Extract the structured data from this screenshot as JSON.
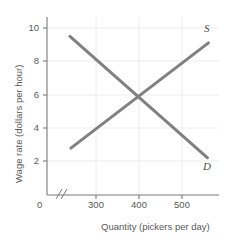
{
  "chart_data": {
    "type": "line",
    "title": "",
    "xlabel": "Quantity (pickers per day)",
    "ylabel": "Wage rate (dollars per hour)",
    "xlim": [
      200,
      575
    ],
    "ylim": [
      0,
      11
    ],
    "xticks": [
      300,
      400,
      500
    ],
    "xtick_labels": [
      "300",
      "400",
      "500"
    ],
    "yticks": [
      0,
      2,
      4,
      6,
      8,
      10
    ],
    "ytick_labels": [
      "0",
      "2",
      "4",
      "6",
      "8",
      "10"
    ],
    "origin_label": "0",
    "grid": true,
    "axis_break": true,
    "legend": "none",
    "series": [
      {
        "name": "D",
        "label": "D",
        "description": "Demand curve, downward sloping",
        "x": [
          250,
          550
        ],
        "values": [
          9.8,
          2.3
        ],
        "color": "#808080"
      },
      {
        "name": "S",
        "label": "S",
        "description": "Supply curve, upward sloping",
        "x": [
          252,
          552
        ],
        "values": [
          2.9,
          9.4
        ],
        "color": "#808080"
      }
    ],
    "equilibrium": {
      "quantity": 400,
      "wage": 6
    },
    "colors": {
      "curve": "#808080",
      "axis": "#7a7a7a",
      "grid": "#ececec",
      "text": "#595959",
      "background": "#ffffff"
    }
  }
}
